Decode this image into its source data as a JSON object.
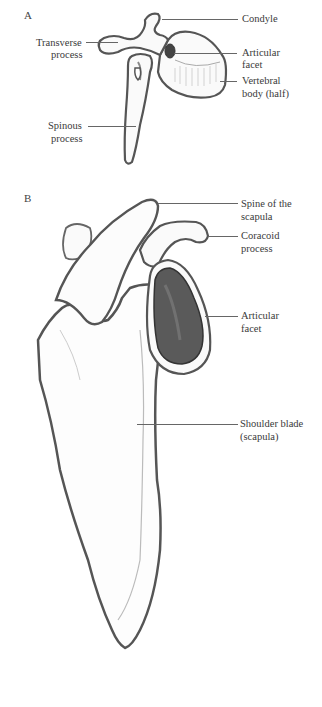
{
  "panels": [
    {
      "letter": "A",
      "subject": "vertebra",
      "labels": {
        "condyle": "Condyle",
        "transverse_process_1": "Transverse",
        "transverse_process_2": "process",
        "articular_facet_1": "Articular",
        "articular_facet_2": "facet",
        "vertebral_body_1": "Vertebral",
        "vertebral_body_2": "body (half)",
        "spinous_process_1": "Spinous",
        "spinous_process_2": "process"
      }
    },
    {
      "letter": "B",
      "subject": "scapula",
      "labels": {
        "spine_1": "Spine of the",
        "spine_2": "scapula",
        "coracoid_1": "Coracoid",
        "coracoid_2": "process",
        "articular_facet_1": "Articular",
        "articular_facet_2": "facet",
        "shoulder_blade_1": "Shoulder blade",
        "shoulder_blade_2": "(scapula)"
      }
    }
  ],
  "colors": {
    "outline": "#555555",
    "shade": "#888888",
    "dark_shade": "#3a3a3a",
    "background": "#ffffff"
  }
}
